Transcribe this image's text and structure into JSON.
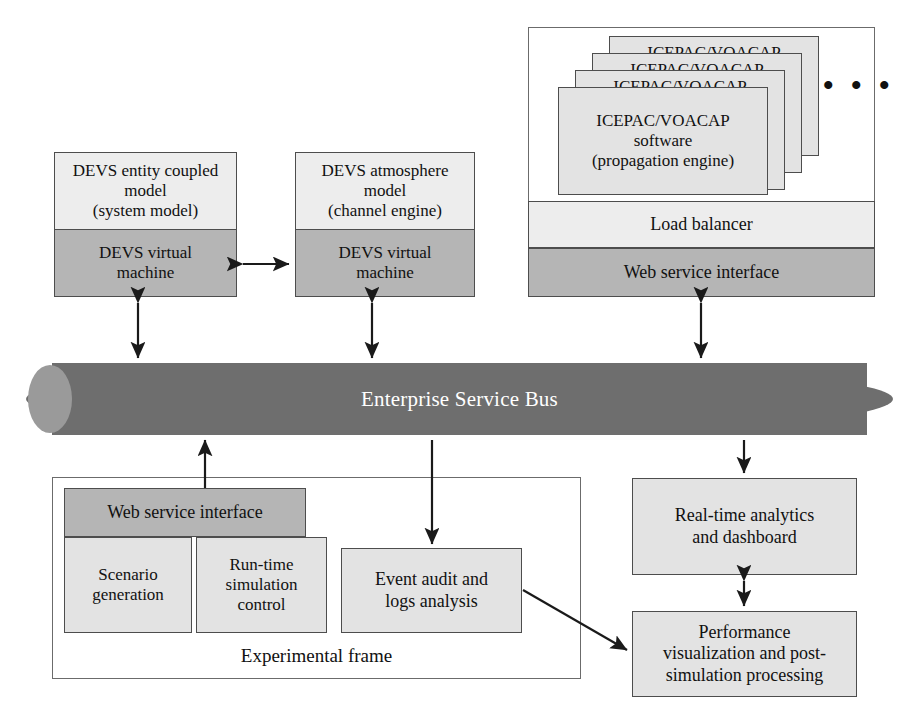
{
  "diagram": {
    "colors": {
      "light_fill": "#ededed",
      "mid_fill": "#e3e3e3",
      "dark_fill": "#b5b5b5",
      "bus_fill": "#6e6e6e",
      "bus_cap": "#9a9a9a",
      "stroke": "#4d4d4d",
      "bus_text": "#ffffff",
      "text": "#111111"
    }
  },
  "devs_models": [
    {
      "id": "entity-coupled",
      "top_label": "DEVS entity coupled\nmodel\n(system model)",
      "bottom_label": "DEVS virtual\nmachine"
    },
    {
      "id": "atmosphere",
      "top_label": "DEVS atmosphere\nmodel\n(channel engine)",
      "bottom_label": "DEVS virtual\nmachine"
    }
  ],
  "propagation_panel": {
    "cards": [
      {
        "label": "ICEPAC/VOACAP"
      },
      {
        "label": "ICEPAC/VOACAP"
      },
      {
        "label": "ICEPAC/VOACAP"
      },
      {
        "label": "ICEPAC/VOACAP\nsoftware\n(propagation engine)"
      }
    ],
    "ellipsis": "• • •",
    "load_balancer_label": "Load balancer",
    "web_service_label": "Web service interface"
  },
  "bus": {
    "label": "Enterprise Service Bus"
  },
  "experimental_frame": {
    "frame_label": "Experimental frame",
    "web_service_label": "Web service interface",
    "sub_boxes": [
      {
        "label": "Scenario\ngeneration"
      },
      {
        "label": "Run-time\nsimulation\ncontrol"
      }
    ]
  },
  "event_audit": {
    "label": "Event audit and\nlogs analysis"
  },
  "analytics": {
    "realtime_label": "Real-time analytics\nand dashboard",
    "performance_label": "Performance\nvisualization and post-\nsimulation processing"
  }
}
